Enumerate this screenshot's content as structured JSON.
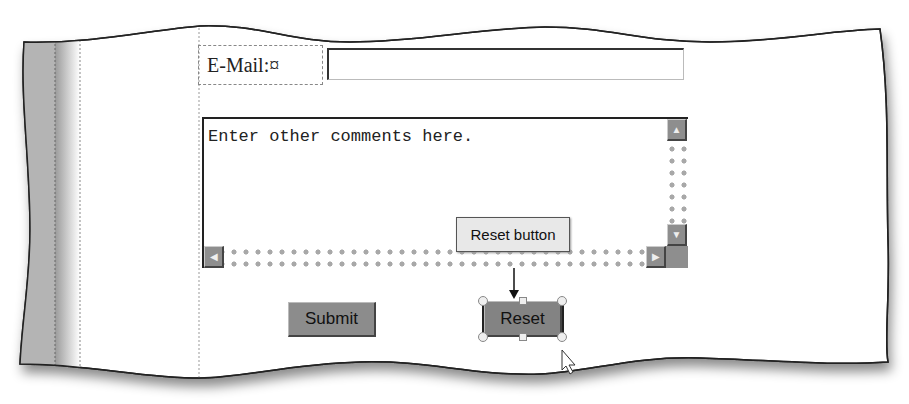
{
  "form": {
    "email_label": "E-Mail:¤",
    "email_value": "",
    "comments_value": "Enter other comments here.",
    "submit_label": "Submit",
    "reset_label": "Reset"
  },
  "callout": {
    "label": "Reset button"
  },
  "icons": {
    "scroll_up": "▲",
    "scroll_down": "▼",
    "scroll_left": "◀",
    "scroll_right": "▶"
  },
  "colors": {
    "button_face": "#8c8c8c",
    "margin_gray": "#b4b4b4",
    "callout_bg": "#e8e8e8"
  }
}
